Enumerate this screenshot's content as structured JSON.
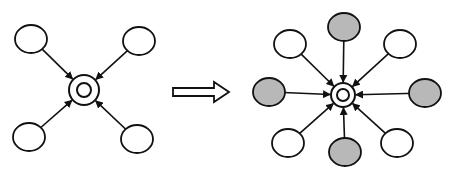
{
  "diagram": {
    "colors": {
      "stroke": "#111111",
      "node_fill_white": "#ffffff",
      "node_fill_shaded": "#b8b8b8",
      "background": "#ffffff"
    },
    "left": {
      "hub": {
        "cx": 84,
        "cy": 90
      },
      "nodes": [
        {
          "id": "tl",
          "cx": 31,
          "cy": 39,
          "shaded": false
        },
        {
          "id": "tr",
          "cx": 139,
          "cy": 41,
          "shaded": false
        },
        {
          "id": "bl",
          "cx": 29,
          "cy": 137,
          "shaded": false
        },
        {
          "id": "br",
          "cx": 137,
          "cy": 139,
          "shaded": false
        }
      ]
    },
    "transition_arrow": {
      "label": "",
      "from_x": 173,
      "to_x": 229,
      "y": 92
    },
    "right": {
      "hub": {
        "cx": 343,
        "cy": 95
      },
      "nodes": [
        {
          "id": "t",
          "cx": 344,
          "cy": 27,
          "shaded": true
        },
        {
          "id": "tl",
          "cx": 290,
          "cy": 44,
          "shaded": false
        },
        {
          "id": "tr",
          "cx": 400,
          "cy": 44,
          "shaded": false
        },
        {
          "id": "l",
          "cx": 269,
          "cy": 92,
          "shaded": true
        },
        {
          "id": "r",
          "cx": 425,
          "cy": 93,
          "shaded": true
        },
        {
          "id": "bl",
          "cx": 288,
          "cy": 143,
          "shaded": false
        },
        {
          "id": "b",
          "cx": 345,
          "cy": 152,
          "shaded": true
        },
        {
          "id": "br",
          "cx": 397,
          "cy": 143,
          "shaded": false
        }
      ]
    }
  }
}
